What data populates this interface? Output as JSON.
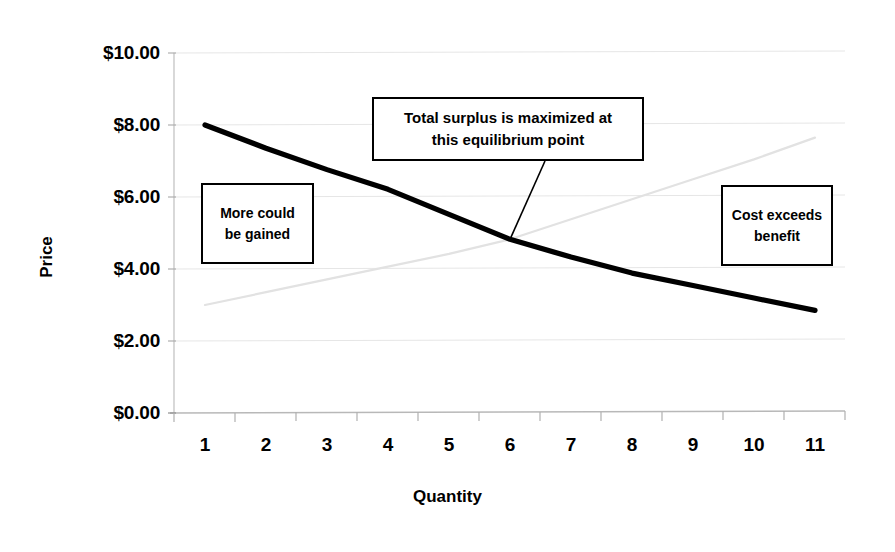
{
  "chart_data": {
    "type": "line",
    "title": "",
    "xlabel": "Quantity",
    "ylabel": "Price",
    "xlim": [
      0.5,
      11.5
    ],
    "ylim": [
      0,
      10
    ],
    "grid": true,
    "legend": "none",
    "x_tick_labels": [
      "1",
      "2",
      "3",
      "4",
      "5",
      "6",
      "7",
      "8",
      "9",
      "10",
      "11"
    ],
    "y_tick_labels": [
      "$0.00",
      "$2.00",
      "$4.00",
      "$6.00",
      "$8.00",
      "$10.00"
    ],
    "y_tick_values": [
      0,
      2,
      4,
      6,
      8,
      10
    ],
    "x": [
      1,
      2,
      3,
      4,
      5,
      6,
      7,
      8,
      9,
      10,
      11
    ],
    "series": [
      {
        "name": "Demand (marginal benefit)",
        "style": "solid-thick-black",
        "color": "#000000",
        "values": [
          8.0,
          7.35,
          6.75,
          6.2,
          5.5,
          4.8,
          4.3,
          3.85,
          3.5,
          3.15,
          2.8
        ]
      },
      {
        "name": "Supply (marginal cost)",
        "style": "faint-thin-gray",
        "color": "#e2e2e2",
        "values": [
          3.0,
          3.35,
          3.7,
          4.05,
          4.4,
          4.8,
          5.35,
          5.9,
          6.45,
          7.0,
          7.6
        ]
      }
    ],
    "annotations": [
      {
        "id": "equilibrium",
        "lines": [
          "Total surplus is maximized at",
          "this equilibrium point"
        ],
        "points_to": {
          "x": 6,
          "y": 4.8
        },
        "has_leader_line": true
      },
      {
        "id": "more-gained",
        "lines": [
          "More could",
          "be gained"
        ],
        "has_leader_line": false
      },
      {
        "id": "cost-exceeds",
        "lines": [
          "Cost exceeds",
          "benefit"
        ],
        "has_leader_line": false
      }
    ],
    "colors": {
      "background": "#ffffff",
      "gridline": "#e8e8e8",
      "axis": "#bcbcbc",
      "demand_line": "#000000",
      "supply_line": "#e2e2e2",
      "text": "#000000",
      "callout_border": "#000000"
    }
  }
}
